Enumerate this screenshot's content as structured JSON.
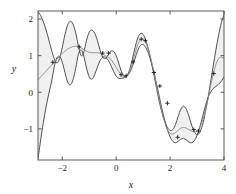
{
  "chart_data": {
    "type": "line",
    "title": "",
    "xlabel": "x",
    "ylabel": "y",
    "xlim": [
      -2.9,
      4.0
    ],
    "ylim": [
      -1.85,
      2.22
    ],
    "xticks": [
      -2,
      0,
      2,
      4
    ],
    "xtick_labels": [
      "−2",
      "0",
      "2",
      "4"
    ],
    "yticks": [
      -1,
      0,
      1,
      2
    ],
    "ytick_labels": [
      "−1",
      "0",
      "1",
      "2"
    ],
    "grid": false,
    "legend": null,
    "colors": {
      "bound_line": "#3c3c3c",
      "mean_line": "#8c8c8c",
      "band_fill": "#f0f0f0",
      "axis": "#4a4a4a",
      "marker": "#1a1a1a",
      "background": "#ffffff"
    },
    "series": [
      {
        "name": "upper bound",
        "style": "solid-dark",
        "x": [
          -2.9,
          -2.8,
          -2.7,
          -2.6,
          -2.5,
          -2.4,
          -2.3,
          -2.2,
          -2.1,
          -2.0,
          -1.9,
          -1.8,
          -1.7,
          -1.6,
          -1.5,
          -1.4,
          -1.3,
          -1.2,
          -1.1,
          -1.0,
          -0.9,
          -0.8,
          -0.7,
          -0.6,
          -0.5,
          -0.4,
          -0.3,
          -0.2,
          -0.1,
          0.0,
          0.1,
          0.2,
          0.3,
          0.4,
          0.5,
          0.6,
          0.7,
          0.8,
          0.9,
          1.0,
          1.1,
          1.2,
          1.3,
          1.4,
          1.5,
          1.6,
          1.7,
          1.8,
          1.9,
          2.0,
          2.1,
          2.2,
          2.3,
          2.4,
          2.5,
          2.6,
          2.7,
          2.8,
          2.9,
          3.0,
          3.1,
          3.2,
          3.3,
          3.4,
          3.5,
          3.6,
          3.7,
          3.8,
          3.9,
          4.0
        ],
        "y": [
          2.2,
          2.1,
          1.92,
          1.7,
          1.44,
          1.16,
          0.92,
          0.8,
          0.92,
          1.22,
          1.58,
          1.84,
          1.94,
          1.86,
          1.62,
          1.26,
          1.0,
          1.1,
          1.42,
          1.64,
          1.7,
          1.62,
          1.42,
          1.16,
          0.96,
          0.92,
          1.02,
          1.12,
          1.12,
          1.0,
          0.78,
          0.56,
          0.44,
          0.46,
          0.62,
          0.9,
          1.22,
          1.48,
          1.6,
          1.58,
          1.42,
          1.16,
          0.84,
          0.48,
          0.1,
          -0.26,
          -0.56,
          -0.8,
          -0.96,
          -1.04,
          -1.02,
          -0.88,
          -0.66,
          -0.46,
          -0.38,
          -0.46,
          -0.66,
          -0.9,
          -1.08,
          -1.16,
          -1.1,
          -0.9,
          -0.58,
          -0.18,
          0.26,
          0.72,
          1.16,
          1.56,
          1.9,
          2.12
        ]
      },
      {
        "name": "mean prediction",
        "style": "solid-light",
        "x": [
          -2.9,
          -2.8,
          -2.7,
          -2.6,
          -2.5,
          -2.4,
          -2.3,
          -2.2,
          -2.1,
          -2.0,
          -1.9,
          -1.8,
          -1.7,
          -1.6,
          -1.5,
          -1.4,
          -1.3,
          -1.2,
          -1.1,
          -1.0,
          -0.9,
          -0.8,
          -0.7,
          -0.6,
          -0.5,
          -0.4,
          -0.3,
          -0.2,
          -0.1,
          0.0,
          0.1,
          0.2,
          0.3,
          0.4,
          0.5,
          0.6,
          0.7,
          0.8,
          0.9,
          1.0,
          1.1,
          1.2,
          1.3,
          1.4,
          1.5,
          1.6,
          1.7,
          1.8,
          1.9,
          2.0,
          2.1,
          2.2,
          2.3,
          2.4,
          2.5,
          2.6,
          2.7,
          2.8,
          2.9,
          3.0,
          3.1,
          3.2,
          3.3,
          3.4,
          3.5,
          3.6,
          3.7,
          3.8,
          3.9,
          4.0
        ],
        "y": [
          0.34,
          0.42,
          0.5,
          0.58,
          0.66,
          0.74,
          0.82,
          0.9,
          0.98,
          1.06,
          1.12,
          1.18,
          1.22,
          1.25,
          1.26,
          1.25,
          1.21,
          1.16,
          1.12,
          1.09,
          1.08,
          1.08,
          1.08,
          1.07,
          1.04,
          1.0,
          0.96,
          0.9,
          0.8,
          0.68,
          0.56,
          0.46,
          0.42,
          0.44,
          0.56,
          0.78,
          1.06,
          1.3,
          1.44,
          1.46,
          1.36,
          1.16,
          0.88,
          0.54,
          0.18,
          -0.2,
          -0.54,
          -0.82,
          -1.02,
          -1.12,
          -1.14,
          -1.1,
          -1.04,
          -0.98,
          -0.96,
          -0.98,
          -1.02,
          -1.06,
          -1.08,
          -1.06,
          -0.96,
          -0.78,
          -0.52,
          -0.2,
          0.16,
          0.5,
          0.76,
          0.92,
          0.96,
          0.92
        ]
      },
      {
        "name": "lower bound",
        "style": "solid-dark",
        "x": [
          -2.9,
          -2.8,
          -2.7,
          -2.6,
          -2.5,
          -2.4,
          -2.3,
          -2.2,
          -2.1,
          -2.0,
          -1.9,
          -1.8,
          -1.7,
          -1.6,
          -1.5,
          -1.4,
          -1.3,
          -1.2,
          -1.1,
          -1.0,
          -0.9,
          -0.8,
          -0.7,
          -0.6,
          -0.5,
          -0.4,
          -0.3,
          -0.2,
          -0.1,
          0.0,
          0.1,
          0.2,
          0.3,
          0.4,
          0.5,
          0.6,
          0.7,
          0.8,
          0.9,
          1.0,
          1.1,
          1.2,
          1.3,
          1.4,
          1.5,
          1.6,
          1.7,
          1.8,
          1.9,
          2.0,
          2.1,
          2.2,
          2.3,
          2.4,
          2.5,
          2.6,
          2.7,
          2.8,
          2.9,
          3.0,
          3.1,
          3.2,
          3.3,
          3.4,
          3.5,
          3.6,
          3.7,
          3.8,
          3.9,
          4.0
        ],
        "y": [
          -1.82,
          -1.3,
          -0.82,
          -0.4,
          -0.04,
          0.28,
          0.68,
          0.94,
          0.98,
          0.82,
          0.54,
          0.28,
          0.2,
          0.34,
          0.66,
          1.04,
          1.16,
          0.98,
          0.66,
          0.42,
          0.36,
          0.48,
          0.68,
          0.86,
          0.96,
          0.96,
          0.88,
          0.74,
          0.58,
          0.44,
          0.38,
          0.38,
          0.4,
          0.44,
          0.54,
          0.7,
          0.92,
          1.14,
          1.28,
          1.3,
          1.22,
          1.06,
          0.82,
          0.54,
          0.22,
          -0.12,
          -0.46,
          -0.76,
          -1.02,
          -1.22,
          -1.34,
          -1.38,
          -1.34,
          -1.28,
          -1.26,
          -1.3,
          -1.36,
          -1.38,
          -1.32,
          -1.18,
          -0.96,
          -0.68,
          -0.4,
          -0.16,
          0.0,
          0.1,
          0.16,
          0.22,
          0.3,
          0.42
        ]
      }
    ],
    "scatter_points": {
      "name": "observations",
      "marker": "plus",
      "x": [
        -2.35,
        -1.37,
        -0.5,
        -0.28,
        0.18,
        0.37,
        0.63,
        0.93,
        1.08,
        1.4,
        1.62,
        1.9,
        2.28,
        2.88,
        3.05,
        3.62
      ],
      "y": [
        0.82,
        1.24,
        1.07,
        1.07,
        0.48,
        0.45,
        0.83,
        1.45,
        1.41,
        0.54,
        0.17,
        -0.3,
        -1.23,
        -1.02,
        -1.06,
        0.51
      ]
    }
  }
}
